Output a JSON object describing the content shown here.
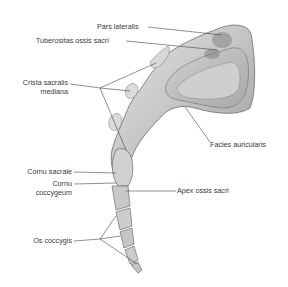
{
  "figure": {
    "labels": {
      "pars_lateralis": "Pars lateralis",
      "tuberositas": "Tuberositas ossis sacri",
      "crista_1": "Crista sacralis",
      "crista_2": "mediana",
      "facies": "Facies auricularis",
      "cornu_sacrale": "Cornu sacrale",
      "cornu_cocc_1": "Cornu",
      "cornu_cocc_2": "coccygeum",
      "apex": "Apex ossis sacri",
      "os_coccygis": "Os coccygis"
    },
    "colors": {
      "bone_light": "#d9d9d9",
      "bone_mid": "#b5b5b5",
      "bone_dark": "#7a7a7a",
      "leader_line": "#444444",
      "text": "#3a3a3a"
    }
  }
}
